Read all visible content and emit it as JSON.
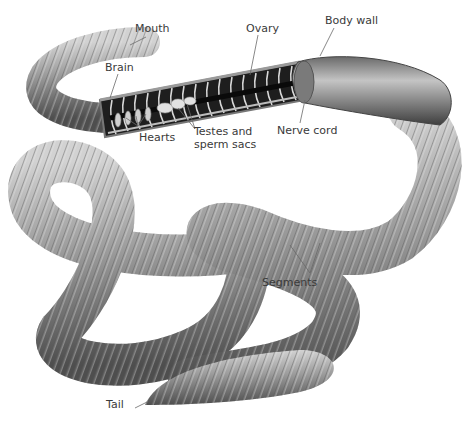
{
  "diagram": {
    "labels": {
      "mouth": "Mouth",
      "brain": "Brain",
      "hearts": "Hearts",
      "testes_line1": "Testes and",
      "testes_line2": "sperm sacs",
      "ovary": "Ovary",
      "body_wall": "Body wall",
      "nerve_cord": "Nerve cord",
      "segments": "Segments",
      "tail": "Tail"
    },
    "colors": {
      "background": "#ffffff",
      "body_light": "#b8b8b8",
      "body_mid": "#8a8a8a",
      "body_dark": "#555555",
      "interior_dark": "#1e1e1e",
      "leader_line": "#6a6a6a",
      "label_text": "#3a3a3a"
    }
  }
}
